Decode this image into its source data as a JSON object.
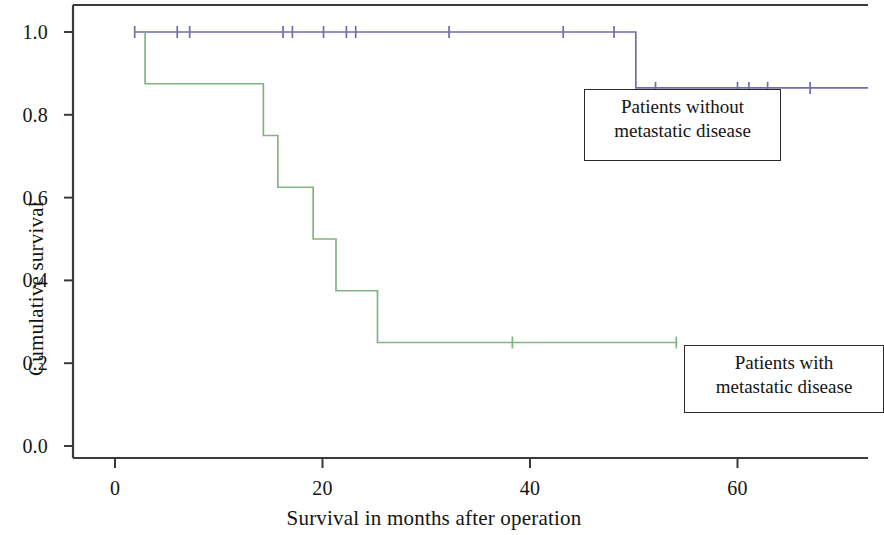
{
  "chart_data": {
    "type": "line",
    "subtype": "kaplan-meier-step",
    "title": "",
    "xlabel": "Survival in months after operation",
    "ylabel": "Cumulative survival",
    "xlim": [
      -4,
      76.6
    ],
    "ylim": [
      -0.06,
      1.095
    ],
    "xticks": [
      0,
      20,
      40,
      60
    ],
    "xtick_labels": [
      "0",
      "20",
      "40",
      "60"
    ],
    "yticks": [
      0.0,
      0.2,
      0.4,
      0.6,
      0.8,
      1.0
    ],
    "ytick_labels": [
      "0.0",
      "0.2",
      "0.4",
      "0.6",
      "0.8",
      "1.0"
    ],
    "grid": false,
    "legend_position": "inside-right",
    "series": [
      {
        "name": "Patients without metastatic disease",
        "color": "#6f6fa6",
        "steps_x": [
          1.9,
          50.2,
          50.2,
          72.6
        ],
        "steps_y": [
          1.0,
          1.0,
          0.865,
          0.865
        ],
        "censor_x": [
          1.9,
          6.0,
          7.2,
          16.2,
          17.1,
          20.1,
          22.3,
          23.2,
          32.2,
          43.2,
          48.1,
          52.1,
          60.0,
          61.1,
          62.9,
          67.0
        ],
        "censor_y": [
          1.0,
          1.0,
          1.0,
          1.0,
          1.0,
          1.0,
          1.0,
          1.0,
          1.0,
          1.0,
          1.0,
          0.865,
          0.865,
          0.865,
          0.865,
          0.865
        ]
      },
      {
        "name": "Patients with metastatic disease",
        "color": "#7fb584",
        "steps_x": [
          2.9,
          2.9,
          14.3,
          14.3,
          15.7,
          15.7,
          19.1,
          19.1,
          21.3,
          21.3,
          25.3,
          25.3,
          54.2
        ],
        "steps_y": [
          1.0,
          0.875,
          0.875,
          0.75,
          0.75,
          0.625,
          0.625,
          0.5,
          0.5,
          0.375,
          0.375,
          0.25,
          0.25
        ],
        "censor_x": [
          38.3,
          54.1
        ],
        "censor_y": [
          0.25,
          0.25
        ]
      }
    ],
    "annotations": [
      {
        "text_line1": "Patients without",
        "text_line2": "metastatic disease"
      },
      {
        "text_line1": "Patients with",
        "text_line2": "metastatic disease"
      }
    ]
  },
  "axes": {
    "y_title": "Cumulative survival",
    "x_title": "Survival in months after operation",
    "y_tick_labels": [
      "1.0",
      "0.8",
      "0.6",
      "0.4",
      "0.2",
      "0.0"
    ],
    "x_tick_labels": [
      "0",
      "20",
      "40",
      "60"
    ]
  },
  "legend": {
    "no_metastasis": {
      "line1": "Patients without",
      "line2": "metastatic disease"
    },
    "metastasis": {
      "line1": "Patients with",
      "line2": "metastatic disease"
    }
  },
  "colors": {
    "series_no_metastasis": "#6f6fa6",
    "series_metastasis": "#7fb584",
    "axis": "#3a3a3a",
    "text": "#141414"
  }
}
